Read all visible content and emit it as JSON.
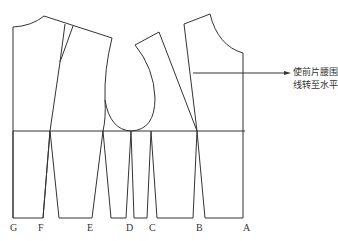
{
  "diagram": {
    "type": "garment pattern (bodice block with waist darts)",
    "annotation": {
      "line1": "使前片腰围",
      "line2": "线转至水平"
    },
    "point_labels": [
      {
        "id": "G",
        "label": "G"
      },
      {
        "id": "F",
        "label": "F"
      },
      {
        "id": "E",
        "label": "E"
      },
      {
        "id": "D",
        "label": "D"
      },
      {
        "id": "C",
        "label": "C"
      },
      {
        "id": "B",
        "label": "B"
      },
      {
        "id": "A",
        "label": "A"
      }
    ],
    "colors": {
      "line": "#333333",
      "background": "#ffffff"
    }
  }
}
